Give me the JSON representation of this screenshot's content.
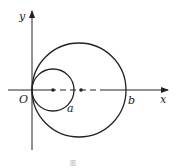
{
  "figure": {
    "labels": {
      "origin": "O",
      "x_axis": "x",
      "y_axis": "y",
      "point_a": "a",
      "point_b": "b"
    },
    "caption": "图",
    "colors": {
      "stroke": "#222222",
      "background": "#ffffff"
    }
  }
}
